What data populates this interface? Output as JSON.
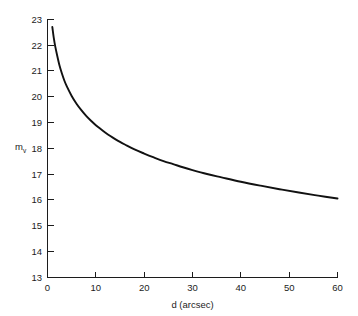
{
  "chart_data": {
    "type": "line",
    "title": "",
    "subtitle": "",
    "xlabel": "d (arcsec)",
    "ylabel": "m",
    "ylabel_subscript": "v",
    "xlim": [
      0,
      60
    ],
    "ylim": [
      13,
      23
    ],
    "grid": false,
    "legend": null,
    "legend_position": "none",
    "xticks": [
      0,
      10,
      20,
      30,
      40,
      50,
      60
    ],
    "xtick_labels": [
      "0",
      "10",
      "20",
      "30",
      "40",
      "50",
      "60"
    ],
    "yticks": [
      13,
      14,
      15,
      16,
      17,
      18,
      19,
      20,
      21,
      22,
      23
    ],
    "ytick_labels": [
      "13",
      "14",
      "15",
      "16",
      "17",
      "18",
      "19",
      "20",
      "21",
      "22",
      "23"
    ],
    "series": [
      {
        "name": "limiting visual magnitude",
        "color": "#111111",
        "linewidth": 1.9,
        "x": [
          1.0,
          1.3,
          1.6,
          2.0,
          2.5,
          3.0,
          3.5,
          4.0,
          5.0,
          6.0,
          7.0,
          8.0,
          9.0,
          10.0,
          11.0,
          12.0,
          13.0,
          14.0,
          15.0,
          16.0,
          18.0,
          20.0,
          22.0,
          24.0,
          26.0,
          28.0,
          30.0,
          33.0,
          36.0,
          40.0,
          44.0,
          48.0,
          52.0,
          56.0,
          60.0
        ],
        "y": [
          22.7,
          22.28,
          21.95,
          21.6,
          21.2,
          20.89,
          20.62,
          20.4,
          20.03,
          19.73,
          19.48,
          19.26,
          19.07,
          18.9,
          18.75,
          18.61,
          18.48,
          18.36,
          18.25,
          18.15,
          17.96,
          17.8,
          17.65,
          17.51,
          17.39,
          17.27,
          17.16,
          17.01,
          16.88,
          16.71,
          16.56,
          16.42,
          16.29,
          16.17,
          16.06
        ]
      }
    ],
    "curve_note": "monotonically decreasing curve from (1, 22.7) to (60, 14.0)"
  },
  "figure": {
    "background_color": "#ffffff",
    "axis_color": "#1c1c1c",
    "curve_color": "#111111"
  }
}
